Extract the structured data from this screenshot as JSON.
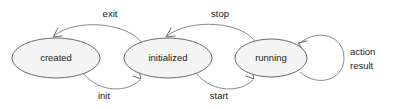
{
  "diagram": {
    "type": "state-machine",
    "background_color": "#ffffff",
    "node_fill_color": "#f4f4f4",
    "node_stroke_color": "#6b6b6b",
    "edge_color": "#8a8a8a",
    "text_color": "#1a1a1a",
    "states": [
      {
        "id": "created",
        "label": "created",
        "cx": 56,
        "cy": 58,
        "rx": 44,
        "ry": 20
      },
      {
        "id": "initialized",
        "label": "initialized",
        "cx": 168,
        "cy": 58,
        "rx": 44,
        "ry": 20
      },
      {
        "id": "running",
        "label": "running",
        "cx": 271,
        "cy": 58,
        "rx": 36,
        "ry": 19
      }
    ],
    "transitions": [
      {
        "id": "exit",
        "label": "exit",
        "from": "initialized",
        "to": "created",
        "label_x": 110,
        "label_y": 14
      },
      {
        "id": "init",
        "label": "init",
        "from": "created",
        "to": "initialized",
        "label_x": 104,
        "label_y": 96
      },
      {
        "id": "stop",
        "label": "stop",
        "from": "running",
        "to": "initialized",
        "label_x": 220,
        "label_y": 14
      },
      {
        "id": "start",
        "label": "start",
        "from": "initialized",
        "to": "running",
        "label_x": 219,
        "label_y": 96
      },
      {
        "id": "action-result",
        "label_line1": "action",
        "label_line2": "result",
        "from": "running",
        "to": "running",
        "label_x": 350,
        "label_y": 52
      }
    ]
  }
}
